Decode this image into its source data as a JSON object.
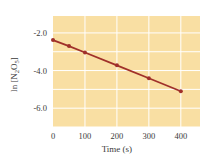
{
  "chart_data": {
    "type": "line",
    "title": "",
    "xlabel": "Time (s)",
    "ylabel": "ln [N2O5]",
    "ylabel_parts": {
      "prefix": "ln [N",
      "sub1": "2",
      "mid": "O",
      "sub2": "5",
      "suffix": "]"
    },
    "x": [
      0,
      50,
      100,
      200,
      300,
      400
    ],
    "series": [
      {
        "name": "ln [N2O5]",
        "values": [
          -2.38,
          -2.7,
          -3.04,
          -3.72,
          -4.41,
          -5.1
        ],
        "color": "#A0302A"
      }
    ],
    "xlim": [
      0,
      460
    ],
    "ylim": [
      -7.0,
      -1.1
    ],
    "xticks": [
      0,
      100,
      200,
      300,
      400
    ],
    "xtick_labels": [
      "0",
      "100",
      "200",
      "300",
      "400"
    ],
    "yticks": [
      -2.0,
      -4.0,
      -6.0
    ],
    "ytick_labels": [
      "-2.0",
      "-4.0",
      "-6.0"
    ],
    "grid": true,
    "grid_y_step": 1.0,
    "grid_x_step": 100,
    "legend": null,
    "colors": {
      "plot_bg": "#F9DFA3",
      "grid": "#FFFFFF",
      "line": "#A0302A"
    }
  }
}
